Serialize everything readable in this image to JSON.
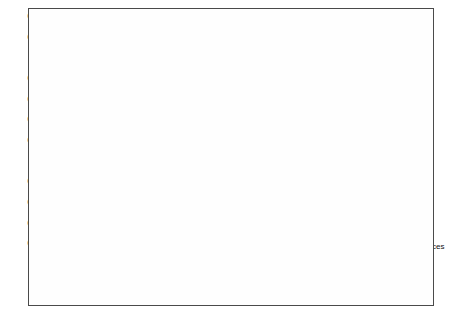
{
  "chart_data": {
    "type": "line",
    "title": "",
    "xlabel": "",
    "ylabel": "",
    "ylim": [
      0,
      0.24
    ],
    "ytick_step": 0.02,
    "minor_grid_step": 0.01,
    "grid": true,
    "legend_position": "bottom-inside",
    "categories": [
      "1976",
      "1977",
      "1978",
      "1979",
      "1980",
      "1981",
      "1982",
      "1983",
      "1984",
      "1985",
      "1986",
      "1987",
      "1988",
      "1989",
      "1990",
      "1991",
      "1992",
      "1993",
      "1994",
      "1995",
      "1996",
      "1997",
      "1998",
      "1999",
      "2000",
      "2001",
      "2002",
      "2003"
    ],
    "ytick_labels": [
      "0",
      "0.02",
      "0.04",
      "0.06",
      "0.08",
      "0.1",
      "0.12",
      "0.14",
      "0.16",
      "0.18",
      "0.2",
      "0.22",
      "0.24"
    ],
    "series": [
      {
        "name": "Manufacturing",
        "marker": "filled-diamond",
        "dash": "solid",
        "values": [
          0.2195,
          0.217,
          0.216,
          0.2175,
          0.221,
          0.2185,
          0.215,
          0.207,
          0.199,
          0.1975,
          0.1985,
          0.1975,
          0.196,
          0.1965,
          0.1905,
          0.179,
          0.169,
          0.1625,
          0.1615,
          0.1655,
          0.1715,
          0.178,
          0.1845,
          0.181,
          0.18,
          0.1765,
          0.172,
          0.163
        ]
      },
      {
        "name": "Construction",
        "marker": "open-square",
        "dash": "solid",
        "values": [
          0.0595,
          0.0585,
          0.056,
          0.0545,
          0.051,
          0.05,
          0.0465,
          0.047,
          0.0435,
          0.042,
          0.0415,
          0.0425,
          0.043,
          0.047,
          0.0475,
          0.048,
          0.0415,
          0.0395,
          0.039,
          0.04,
          0.0395,
          0.0395,
          0.039,
          0.04,
          0.0415,
          0.0425,
          0.044,
          0.0465
        ]
      },
      {
        "name": "Retail trade",
        "marker": "open-triangle",
        "dash": "dashed",
        "values": [
          0.1205,
          0.118,
          0.1175,
          0.117,
          0.1175,
          0.117,
          0.118,
          0.12,
          0.1215,
          0.122,
          0.1225,
          0.1215,
          0.122,
          0.1225,
          0.122,
          0.1215,
          0.122,
          0.1225,
          0.122,
          0.1215,
          0.1215,
          0.121,
          0.122,
          0.122,
          0.123,
          0.124,
          0.1245,
          0.124
        ]
      },
      {
        "name": "Community Services",
        "marker": "cross-x",
        "dash": "dashed",
        "values": [
          0.164,
          0.1655,
          0.165,
          0.164,
          0.1605,
          0.1585,
          0.158,
          0.166,
          0.175,
          0.1765,
          0.1755,
          0.1765,
          0.1775,
          0.179,
          0.184,
          0.1885,
          0.194,
          0.1985,
          0.199,
          0.196,
          0.193,
          0.1905,
          0.1835,
          0.184,
          0.1835,
          0.1825,
          0.184,
          0.187
        ]
      }
    ]
  }
}
